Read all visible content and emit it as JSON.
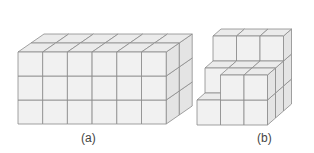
{
  "figure": {
    "colors": {
      "front": "#f1f1f1",
      "top": "#ebebeb",
      "side": "#e4e4e4",
      "stroke": "#8a8a8a",
      "caption": "#444444"
    },
    "panels": [
      {
        "id": "a",
        "caption": "(a)",
        "description": "Rectangular prism of unit cubes: 6 wide, 3 high, 2 deep",
        "origin": [
          18,
          124
        ],
        "cell": [
          24.7,
          24
        ],
        "depth_offset": [
          13,
          -9
        ],
        "columns": [
          {
            "x": 0,
            "heights": [
              3,
              3
            ]
          },
          {
            "x": 1,
            "heights": [
              3,
              3
            ]
          },
          {
            "x": 2,
            "heights": [
              3,
              3
            ]
          },
          {
            "x": 3,
            "heights": [
              3,
              3
            ]
          },
          {
            "x": 4,
            "heights": [
              3,
              3
            ]
          },
          {
            "x": 5,
            "heights": [
              3,
              3
            ]
          }
        ]
      },
      {
        "id": "b",
        "caption": "(b)",
        "description": "Staircase arrangement of unit cubes, 3 wide, 3 deep, up to 3 high",
        "origin": [
          197,
          125
        ],
        "cell": [
          23.5,
          25
        ],
        "depth_offset": [
          8,
          -7
        ],
        "columns": [
          {
            "x": 0,
            "heights": [
              1,
              2,
              3
            ]
          },
          {
            "x": 1,
            "heights": [
              2,
              2,
              3
            ]
          },
          {
            "x": 2,
            "heights": [
              2,
              2,
              3
            ]
          }
        ]
      }
    ]
  }
}
